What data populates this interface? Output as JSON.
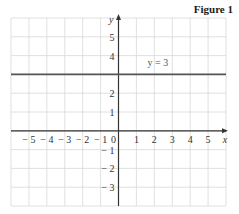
{
  "figure_title": "Figure 1",
  "chart_data": {
    "type": "line",
    "title": "Figure 1",
    "xlabel": "x",
    "ylabel": "y",
    "xlim": [
      -6,
      6
    ],
    "ylim": [
      -4,
      6
    ],
    "grid": true,
    "x_ticks": [
      -5,
      -4,
      -3,
      -2,
      -1,
      0,
      1,
      2,
      3,
      4,
      5
    ],
    "x_tick_labels": [
      "− 5",
      "− 4",
      "− 3",
      "− 2",
      "− 1",
      "0",
      "1",
      "2",
      "3",
      "4",
      "5"
    ],
    "y_ticks": [
      5,
      4,
      2,
      1,
      -1,
      -2,
      -3
    ],
    "y_tick_labels": [
      "5",
      "4",
      "2",
      "1",
      "− 1",
      "− 2",
      "− 3"
    ],
    "series": [
      {
        "name": "y = 3",
        "equation": "y = 3",
        "x": [
          -6,
          6
        ],
        "y": [
          3,
          3
        ],
        "color": "#555555"
      }
    ],
    "annotations": [
      {
        "text": "y = 3",
        "x": 2.2,
        "y": 3.6
      }
    ]
  }
}
